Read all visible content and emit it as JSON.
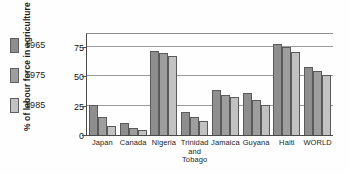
{
  "chart_data": {
    "type": "bar",
    "title": "",
    "xlabel": "",
    "ylabel": "% of labour force in agriculture",
    "ylim": [
      0,
      87
    ],
    "yticks": [
      0,
      25,
      50,
      75
    ],
    "grid": true,
    "legend_position": "left",
    "categories": [
      "Japan",
      "Canada",
      "Nigeria",
      "Trinidad and Tobago",
      "Jamaica",
      "Guyana",
      "Haiti",
      "WORLD"
    ],
    "series": [
      {
        "name": "1965",
        "color": "#8e8e8e",
        "values": [
          26,
          10,
          72,
          20,
          38,
          36,
          78,
          58
        ]
      },
      {
        "name": "1975",
        "color": "#9e9e9e",
        "values": [
          15,
          6,
          70,
          15,
          34,
          30,
          75,
          55
        ]
      },
      {
        "name": "1985",
        "color": "#c2c2c2",
        "values": [
          8,
          4,
          67,
          12,
          32,
          26,
          71,
          51
        ]
      }
    ]
  },
  "legend": {
    "items": [
      {
        "label": "1965",
        "color": "#8e8e8e"
      },
      {
        "label": "1975",
        "color": "#9e9e9e"
      },
      {
        "label": "1985",
        "color": "#c2c2c2"
      }
    ]
  },
  "axis": {
    "y_title": "% of labour force in agriculture",
    "y_tick_labels": [
      "75",
      "50",
      "25",
      "0"
    ]
  },
  "x_labels": [
    {
      "line1": "Japan",
      "line2": "",
      "line3": ""
    },
    {
      "line1": "Canada",
      "line2": "",
      "line3": ""
    },
    {
      "line1": "Nigeria",
      "line2": "",
      "line3": ""
    },
    {
      "line1": "Trinidad",
      "line2": "and",
      "line3": "Tobago"
    },
    {
      "line1": "Jamaica",
      "line2": "",
      "line3": ""
    },
    {
      "line1": "Guyana",
      "line2": "",
      "line3": ""
    },
    {
      "line1": "Haiti",
      "line2": "",
      "line3": ""
    },
    {
      "line1": "WORLD",
      "line2": "",
      "line3": ""
    }
  ]
}
